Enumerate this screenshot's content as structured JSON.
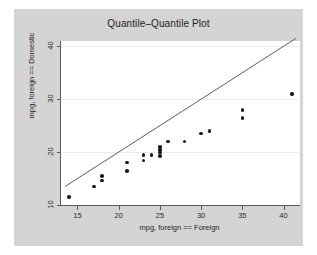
{
  "figure": {
    "title": "Quantile–Quantile Plot",
    "background_color": "#d4d4d4",
    "plot_background_color": "#ffffff",
    "marker_color": "#1a1a1a",
    "line_color": "#4a4a4a",
    "grid_color": "#ececec"
  },
  "chart_data": {
    "type": "scatter",
    "title": "Quantile–Quantile Plot",
    "xlabel": "mpg, foreign == Foreign",
    "ylabel": "mpg, foreign == Domestic",
    "xlim": [
      13,
      42
    ],
    "ylim": [
      10,
      41
    ],
    "xticks": [
      15,
      20,
      25,
      30,
      35,
      40
    ],
    "xticklabels": [
      "15",
      "20",
      "25",
      "30",
      "35",
      "40"
    ],
    "yticks": [
      10,
      20,
      30,
      40
    ],
    "yticklabels": [
      "10",
      "20",
      "30",
      "40"
    ],
    "grid": true,
    "grid_axis": "y",
    "legend": null,
    "series": [
      {
        "name": "quantile-pairs",
        "type": "scatter",
        "points": [
          [
            14,
            11.5
          ],
          [
            17,
            13.5
          ],
          [
            18,
            14.6
          ],
          [
            18,
            15.5
          ],
          [
            21,
            16.4
          ],
          [
            21,
            18.0
          ],
          [
            23,
            18.4
          ],
          [
            23,
            19.4
          ],
          [
            24,
            19.4
          ],
          [
            25,
            19.3
          ],
          [
            25,
            19.9
          ],
          [
            25,
            20.4
          ],
          [
            25,
            21.0
          ],
          [
            26,
            22.0
          ],
          [
            28,
            22.0
          ],
          [
            30,
            23.5
          ],
          [
            31,
            24.0
          ],
          [
            35,
            26.5
          ],
          [
            35,
            28.0
          ],
          [
            41,
            31.0
          ]
        ]
      },
      {
        "name": "reference-line",
        "type": "line",
        "points": [
          [
            13.5,
            13.5
          ],
          [
            41.5,
            41.5
          ]
        ],
        "description": "y = x identity reference line"
      }
    ]
  }
}
